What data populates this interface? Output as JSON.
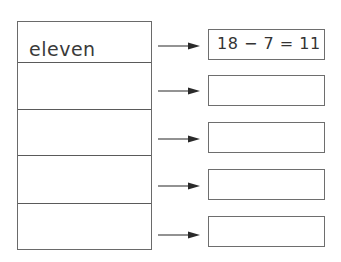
{
  "worksheet": {
    "rows": [
      {
        "word": "eleven",
        "equation": "18 − 7 = 11"
      },
      {
        "word": "",
        "equation": ""
      },
      {
        "word": "",
        "equation": ""
      },
      {
        "word": "",
        "equation": ""
      },
      {
        "word": "",
        "equation": ""
      }
    ],
    "icons": {
      "arrow": "arrow-right-icon"
    },
    "colors": {
      "line": "#6a6a6a",
      "text": "#3a3a3a"
    }
  }
}
